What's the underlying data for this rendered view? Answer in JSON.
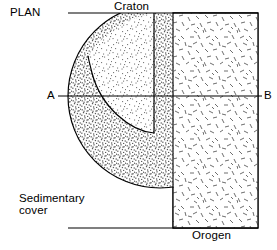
{
  "figure": {
    "view_label": "PLAN",
    "labels": {
      "craton": "Craton",
      "orogen": "Orogen",
      "sedimentary_cover_line1": "Sedimentary",
      "sedimentary_cover_line2": "cover",
      "section_start": "A",
      "section_end": "B"
    },
    "colors": {
      "outline": "#000000",
      "section_line": "#000000",
      "craton_fill": "#f6f6f6",
      "sedimentary_fill": "#e0e0e0",
      "orogen_fill": "#fbfbfb",
      "background": "#ffffff"
    },
    "geometry": {
      "frame": {
        "x": 173,
        "y": 13,
        "width": 85,
        "height": 215
      },
      "circle": {
        "cx": 160,
        "cy": 96,
        "r": 92
      },
      "craton_inner_vertical_x": 154,
      "craton_inner_vertical_y_end": 133,
      "section_line_y": 96,
      "section_line_x_start": 58,
      "section_line_x_end": 262
    }
  }
}
